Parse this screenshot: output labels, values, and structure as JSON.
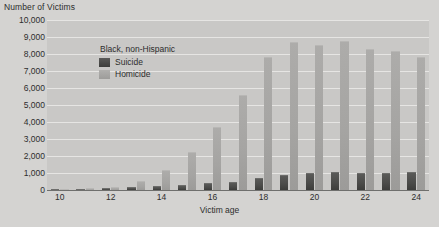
{
  "chart_data": {
    "type": "bar",
    "title": "",
    "group_title": "Black, non-Hispanic",
    "xlabel": "Victim age",
    "ylabel": "Number of Victims",
    "grid": true,
    "legend_position": "top-left inside plot",
    "xlim": [
      9.5,
      24.5
    ],
    "ylim": [
      0,
      10000
    ],
    "ytick_labels": [
      "10,000",
      "9,000",
      "8,000",
      "7,000",
      "6,000",
      "5,000",
      "4,000",
      "3,000",
      "2,000",
      "1,000",
      "0"
    ],
    "ytick_values": [
      10000,
      9000,
      8000,
      7000,
      6000,
      5000,
      4000,
      3000,
      2000,
      1000,
      0
    ],
    "categories": [
      10,
      11,
      12,
      13,
      14,
      15,
      16,
      17,
      18,
      19,
      20,
      21,
      22,
      23,
      24
    ],
    "xtick_labels": [
      "10",
      "",
      "12",
      "",
      "14",
      "",
      "16",
      "",
      "18",
      "",
      "20",
      "",
      "22",
      "",
      "24"
    ],
    "series": [
      {
        "name": "Suicide",
        "color": "#4c4c4a",
        "values": [
          30,
          60,
          90,
          170,
          230,
          310,
          390,
          450,
          700,
          900,
          1000,
          1080,
          1030,
          980,
          1080
        ]
      },
      {
        "name": "Homicide",
        "color": "#a5a4a2",
        "values": [
          60,
          110,
          200,
          520,
          1160,
          2250,
          3700,
          5600,
          7800,
          8700,
          8550,
          8750,
          8300,
          8150,
          7800
        ]
      }
    ]
  },
  "axes": {
    "y_title": "Number of Victims",
    "x_title": "Victim age"
  },
  "legend": {
    "title": "Black, non-Hispanic",
    "entries": [
      {
        "label": "Suicide",
        "swatch": "suicide"
      },
      {
        "label": "Homicide",
        "swatch": "homicide"
      }
    ]
  }
}
